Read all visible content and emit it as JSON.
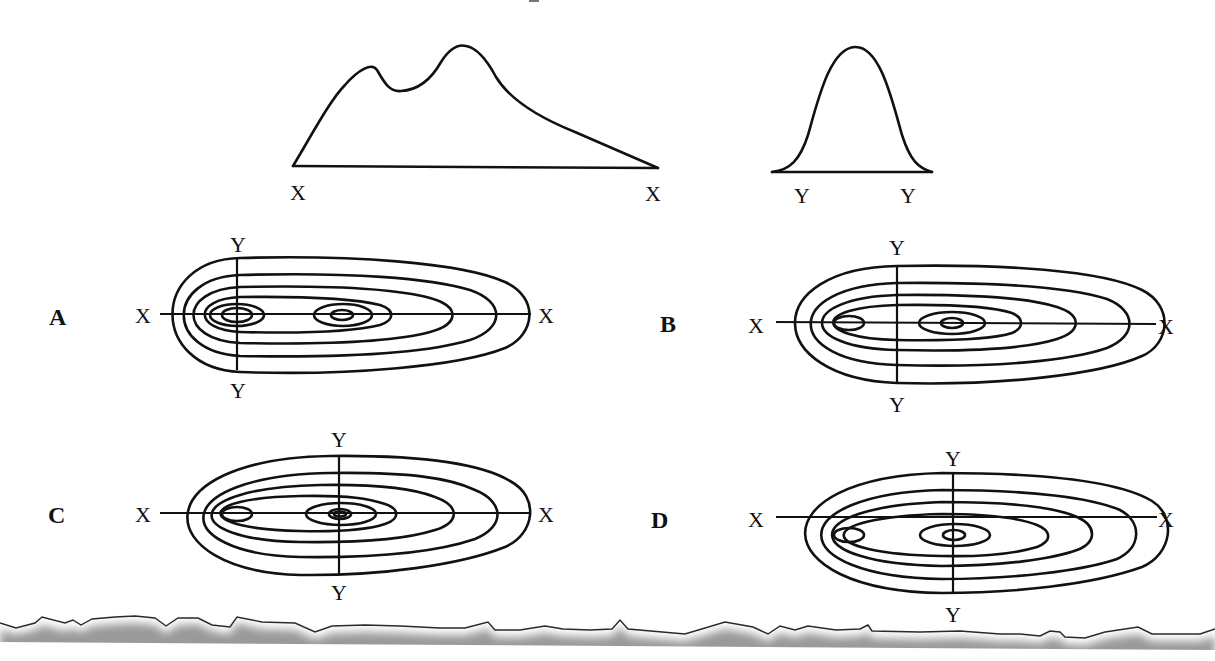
{
  "profiles": {
    "x_profile": {
      "description": "Cross-section along X-X: two peaks, smaller left hill and taller right peak with a long gentle slope to the right",
      "left_label": "X",
      "right_label": "X"
    },
    "y_profile": {
      "description": "Cross-section along Y-Y: single symmetric bell-shaped peak",
      "left_label": "Y",
      "right_label": "Y"
    }
  },
  "options": [
    {
      "letter": "A",
      "x_left": "X",
      "x_right": "X",
      "y_top": "Y",
      "y_bottom": "Y",
      "y_line_position": "through small left hill"
    },
    {
      "letter": "B",
      "x_left": "X",
      "x_right": "X",
      "y_top": "Y",
      "y_bottom": "Y",
      "y_line_position": "between the two hills"
    },
    {
      "letter": "C",
      "x_left": "X",
      "x_right": "X",
      "y_top": "Y",
      "y_bottom": "Y",
      "y_line_position": "through main peak"
    },
    {
      "letter": "D",
      "x_left": "X",
      "x_right": "X",
      "y_top": "Y",
      "y_bottom": "Y",
      "y_line_position": "through main peak; X-X line offset above the peaks"
    }
  ],
  "style": {
    "line_color": "#111111",
    "background": "#ffffff",
    "torn_edge_shadow": "#9a9a9a"
  }
}
